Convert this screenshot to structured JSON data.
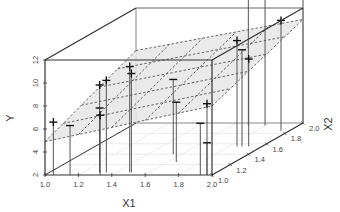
{
  "chart_data": {
    "type": "scatter",
    "subtype": "scatter3d-with-regression-plane",
    "title": "",
    "xlabel": "X1",
    "ylabel": "Y",
    "zlabel": "X2",
    "axes": {
      "x1": {
        "label": "X1",
        "range": [
          1.0,
          2.0
        ],
        "ticks": [
          "1.0",
          "1.2",
          "1.4",
          "1.6",
          "1.8",
          "2.0"
        ]
      },
      "y": {
        "label": "Y",
        "range": [
          2,
          12
        ],
        "ticks": [
          "2",
          "4",
          "6",
          "8",
          "10",
          "12"
        ]
      },
      "x2": {
        "label": "X2",
        "range": [
          1.0,
          2.0
        ],
        "ticks": [
          "1.0",
          "1.2",
          "1.4",
          "1.6",
          "1.8",
          "2.0"
        ]
      }
    },
    "grid": false,
    "legend": null,
    "plane": {
      "description": "fitted regression plane, light gray fill with dashed grid lines",
      "fill": "#e6e6e6",
      "line_color": "#444444",
      "corners": [
        {
          "x1": 1.0,
          "x2": 1.0,
          "y": 4.9
        },
        {
          "x1": 2.0,
          "x2": 1.0,
          "y": 8.0
        },
        {
          "x1": 2.0,
          "x2": 2.0,
          "y": 11.0
        },
        {
          "x1": 1.0,
          "x2": 2.0,
          "y": 8.3
        }
      ],
      "grid_divisions": 5
    },
    "points": [
      {
        "x1": 1.05,
        "x2": 1.0,
        "y": 6.6,
        "above_plane": true
      },
      {
        "x1": 1.15,
        "x2": 1.0,
        "y": 6.3,
        "above_plane": false
      },
      {
        "x1": 1.3,
        "x2": 1.05,
        "y": 9.6,
        "above_plane": true
      },
      {
        "x1": 1.3,
        "x2": 1.05,
        "y": 7.6,
        "above_plane": false
      },
      {
        "x1": 1.34,
        "x2": 1.05,
        "y": 10.0,
        "above_plane": true
      },
      {
        "x1": 1.33,
        "x2": 1.0,
        "y": 7.2,
        "above_plane": true
      },
      {
        "x1": 1.48,
        "x2": 1.05,
        "y": 11.2,
        "above_plane": true
      },
      {
        "x1": 1.49,
        "x2": 1.05,
        "y": 10.6,
        "above_plane": true
      },
      {
        "x1": 1.55,
        "x2": 1.4,
        "y": 8.5,
        "above_plane": false
      },
      {
        "x1": 1.65,
        "x2": 1.25,
        "y": 7.2,
        "above_plane": false
      },
      {
        "x1": 1.93,
        "x2": 1.0,
        "y": 6.5,
        "above_plane": false
      },
      {
        "x1": 1.97,
        "x2": 1.0,
        "y": 8.2,
        "above_plane": true
      },
      {
        "x1": 1.97,
        "x2": 1.0,
        "y": 4.8,
        "above_plane": false
      },
      {
        "x1": 1.85,
        "x2": 1.55,
        "y": 11.2,
        "above_plane": true
      },
      {
        "x1": 1.88,
        "x2": 1.55,
        "y": 10.4,
        "above_plane": false
      },
      {
        "x1": 1.92,
        "x2": 1.55,
        "y": 9.6,
        "above_plane": true
      },
      {
        "x1": 1.7,
        "x2": 1.95,
        "y": 14.5,
        "above_plane": true
      },
      {
        "x1": 1.8,
        "x2": 1.95,
        "y": 14.0,
        "above_plane": true
      },
      {
        "x1": 1.95,
        "x2": 1.85,
        "y": 11.6,
        "above_plane": true
      },
      {
        "x1": 2.0,
        "x2": 2.0,
        "y": 13.5,
        "above_plane": true
      }
    ],
    "marker": "+ for points above plane, − for points below plane, with vertical drop lines to floor",
    "colors": {
      "axes": "#333333",
      "plane_fill": "#e6e6e6",
      "points": "#111111",
      "drop_lines": "#555555"
    }
  },
  "labels": {
    "x1_axis": "X1",
    "y_axis": "Y",
    "x2_axis": "X2"
  }
}
